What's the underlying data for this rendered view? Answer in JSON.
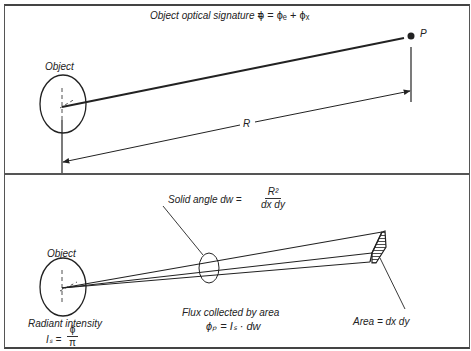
{
  "top_panel": {
    "title_label": "Object optical signature =",
    "title_equation": "ϕ  = ϕₑ + ϕₓ",
    "object_label": "Object",
    "point_label": "P",
    "distance_label": "R"
  },
  "bottom_panel": {
    "object_label": "Object",
    "solid_angle_label": "Solid angle dw =",
    "solid_angle_numerator": "R²",
    "solid_angle_denominator": "dx dy",
    "flux_label": "Flux collected by area",
    "flux_equation": "ϕₚ = Iₛ · dw",
    "area_label": "Area = dx dy",
    "radiant_label": "Radiant intensity",
    "radiant_lhs": "Iₛ =",
    "radiant_numerator": "ϕ",
    "radiant_denominator": "π"
  },
  "colors": {
    "ink": "#222222",
    "border": "#555555",
    "background": "#ffffff"
  }
}
